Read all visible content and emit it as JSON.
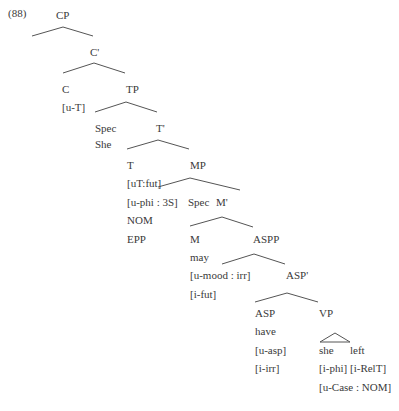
{
  "example_number": "(88)",
  "tree": {
    "CP": "CP",
    "C_bar": "C'",
    "C": "C",
    "C_feat": "[u-T]",
    "TP": "TP",
    "Spec_TP": "Spec",
    "Spec_TP_word": "She",
    "T_bar": "T'",
    "T": "T",
    "T_feat1": "[uT:fut]",
    "T_feat2": "[u-phi : 3S]",
    "T_feat3": "NOM",
    "T_feat4": "EPP",
    "MP": "MP",
    "Spec_MP": "Spec",
    "M_bar": "M'",
    "M": "M",
    "M_word": "may",
    "M_feat1": "[u-mood : irr]",
    "M_feat2": "[i-fut]",
    "ASPP": "ASPP",
    "ASP_bar": "ASP'",
    "ASP": "ASP",
    "ASP_word": "have",
    "ASP_feat1": "[u-asp]",
    "ASP_feat2": "[i-irr]",
    "VP": "VP",
    "VP_word1": "she",
    "VP_word2": "left",
    "VP_feat1": "[i-phi]",
    "VP_feat2": "[i-RelT]",
    "VP_feat3": "[u-Case : NOM]"
  }
}
